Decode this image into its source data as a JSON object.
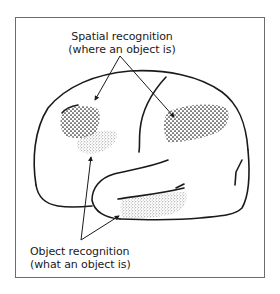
{
  "diagram": {
    "type": "brain-lateral-view",
    "labels": {
      "spatial": {
        "line1": "Spatial recognition",
        "line2": "(where an object is)"
      },
      "object": {
        "line1": "Object recognition",
        "line2": "(what an object is)"
      }
    },
    "regions": [
      {
        "name": "parietal-frontal-spatial-region",
        "pattern": "coarse-dots",
        "role": "spatial"
      },
      {
        "name": "parietal-spatial-region",
        "pattern": "coarse-dots",
        "role": "spatial"
      },
      {
        "name": "occipital-object-region",
        "pattern": "fine-stipple",
        "role": "object"
      },
      {
        "name": "temporal-object-region",
        "pattern": "fine-stipple",
        "role": "object"
      }
    ],
    "colors": {
      "ink": "#1a1a1a",
      "frame": "#6b6b6b",
      "background": "#ffffff"
    }
  }
}
